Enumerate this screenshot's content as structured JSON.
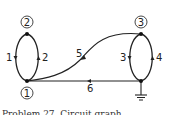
{
  "graph": {
    "nodes": [
      {
        "id": "1",
        "label": "1",
        "x": 27,
        "y": 81,
        "circled": true,
        "label_x": 27,
        "label_y": 93
      },
      {
        "id": "2",
        "label": "2",
        "x": 27,
        "y": 34,
        "circled": true,
        "label_x": 27,
        "label_y": 22
      },
      {
        "id": "3",
        "label": "3",
        "x": 141,
        "y": 34,
        "circled": true,
        "label_x": 141,
        "label_y": 22
      },
      {
        "id": "g",
        "label": "",
        "x": 141,
        "y": 81,
        "circled": false,
        "ground": true
      }
    ],
    "edges": [
      {
        "id": "e1",
        "label": "1",
        "from": "2",
        "to": "1",
        "direction": "down"
      },
      {
        "id": "e2",
        "label": "2",
        "from": "1",
        "to": "2",
        "direction": "up"
      },
      {
        "id": "e3",
        "label": "3",
        "from": "3",
        "to": "g",
        "direction": "down"
      },
      {
        "id": "e4",
        "label": "4",
        "from": "g",
        "to": "3",
        "direction": "up"
      },
      {
        "id": "e5",
        "label": "5",
        "from": "3",
        "to": "1",
        "direction": "curved"
      },
      {
        "id": "e6",
        "label": "6",
        "from": "g",
        "to": "1",
        "direction": "left"
      }
    ]
  },
  "labels": {
    "n1": "1",
    "n2": "2",
    "n3": "3",
    "e1": "1",
    "e2": "2",
    "e3": "3",
    "e4": "4",
    "e5": "5",
    "e6": "6"
  },
  "caption": "Problem 27. Circuit graph"
}
